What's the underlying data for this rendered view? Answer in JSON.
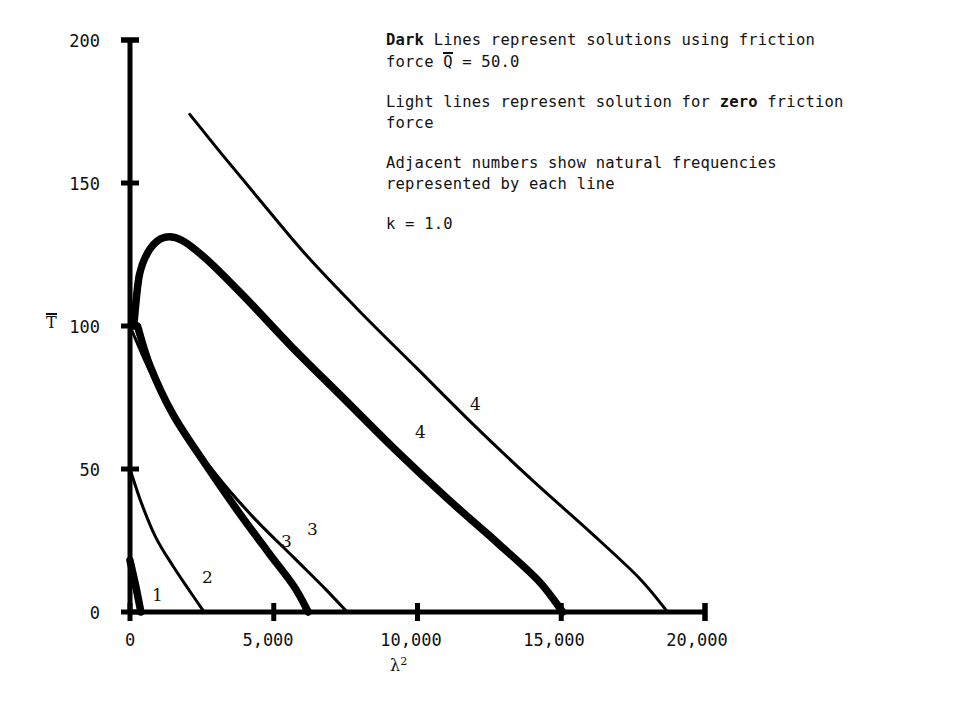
{
  "legend": {
    "lines": [
      {
        "bold_prefix": "Dark",
        "rest": " Lines represent solutions using friction"
      },
      {
        "pre": "force ",
        "overbar_symbol": "Q",
        "post": " = 50.0"
      },
      {
        "pre": "Light lines represent solution for ",
        "bold_word": "zero",
        "post": " friction"
      },
      {
        "text": "force"
      },
      {
        "text": "Adjacent numbers show natural frequencies"
      },
      {
        "text": "represented by each line"
      },
      {
        "text": "k = 1.0"
      }
    ],
    "line1_bold": "Dark",
    "line1_rest": " Lines represent solutions using friction",
    "line2_pre": "force ",
    "line2_sym": "Q",
    "line2_post": " = 50.0",
    "line3_pre": "Light lines represent solution for ",
    "line3_bold": "zero",
    "line3_post": " friction",
    "line4": "force",
    "line5": "Adjacent numbers show natural frequencies",
    "line6": "represented by each line",
    "line7": "k = 1.0"
  },
  "axes": {
    "ylabel": "T",
    "xlabel_base": "λ",
    "xlabel_exp": "2",
    "yticks": [
      "0",
      "50",
      "100",
      "150",
      "200"
    ],
    "xticks": [
      "0",
      "5,000",
      "10,000",
      "15,000",
      "20,000"
    ],
    "axis_color": "#000000"
  },
  "curve_labels": {
    "dark_1": "1",
    "light_2": "2",
    "dark_3": "3",
    "light_3": "3",
    "dark_4": "4",
    "light_4": "4"
  },
  "chart_data": {
    "type": "line",
    "title": "",
    "xlabel": "lambda^2",
    "ylabel": "T-bar",
    "xlim": [
      0,
      20000
    ],
    "ylim": [
      0,
      200
    ],
    "xticks": [
      0,
      5000,
      10000,
      15000,
      20000
    ],
    "yticks": [
      0,
      50,
      100,
      150,
      200
    ],
    "grid": false,
    "legend_position": "upper-right-text-block",
    "parameters": {
      "k": 1.0,
      "friction_force_Qbar": 50.0
    },
    "series": [
      {
        "name": "mode 1 (dark, friction)",
        "style": "dark",
        "frequency": 1,
        "points": [
          [
            0,
            18
          ],
          [
            180,
            10
          ],
          [
            380,
            0
          ]
        ]
      },
      {
        "name": "mode 1 (light, zero friction)",
        "style": "light",
        "frequency": 1,
        "points": [
          [
            0,
            16
          ],
          [
            200,
            6
          ],
          [
            420,
            0
          ]
        ]
      },
      {
        "name": "mode 2 (light, zero friction)",
        "style": "light",
        "frequency": 2,
        "points": [
          [
            0,
            50
          ],
          [
            400,
            38
          ],
          [
            900,
            26
          ],
          [
            1500,
            16
          ],
          [
            2100,
            7
          ],
          [
            2580,
            0
          ]
        ]
      },
      {
        "name": "mode 3 (dark, friction)",
        "style": "dark",
        "frequency": 3,
        "points": [
          [
            260,
            100
          ],
          [
            700,
            86
          ],
          [
            1500,
            69
          ],
          [
            2600,
            52
          ],
          [
            3700,
            36
          ],
          [
            4800,
            21
          ],
          [
            5700,
            9
          ],
          [
            6200,
            0
          ]
        ]
      },
      {
        "name": "mode 3 (light, zero friction)",
        "style": "light",
        "frequency": 3,
        "points": [
          [
            0,
            100
          ],
          [
            700,
            84
          ],
          [
            1700,
            66
          ],
          [
            3000,
            48
          ],
          [
            4300,
            33
          ],
          [
            5700,
            19
          ],
          [
            6800,
            8
          ],
          [
            7550,
            0
          ]
        ]
      },
      {
        "name": "mode 4 (dark, friction)",
        "style": "dark",
        "frequency": 4,
        "points": [
          [
            130,
            100
          ],
          [
            330,
            118
          ],
          [
            700,
            127
          ],
          [
            1200,
            131
          ],
          [
            1800,
            130
          ],
          [
            2700,
            123
          ],
          [
            4000,
            110
          ],
          [
            5600,
            93
          ],
          [
            7400,
            75
          ],
          [
            9200,
            57
          ],
          [
            11000,
            40
          ],
          [
            12800,
            24
          ],
          [
            14200,
            11
          ],
          [
            15050,
            0
          ]
        ]
      },
      {
        "name": "mode 4 (light, zero friction)",
        "style": "light",
        "frequency": 4,
        "points": [
          [
            2080,
            174
          ],
          [
            3200,
            160
          ],
          [
            4600,
            143
          ],
          [
            6200,
            124
          ],
          [
            8000,
            105
          ],
          [
            10000,
            85
          ],
          [
            12000,
            65
          ],
          [
            14000,
            46
          ],
          [
            16000,
            28
          ],
          [
            17700,
            12
          ],
          [
            18700,
            0
          ]
        ]
      }
    ]
  }
}
